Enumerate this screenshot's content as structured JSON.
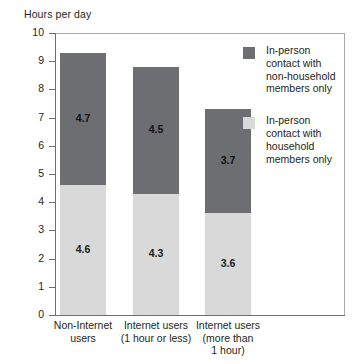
{
  "chart_data": {
    "type": "bar",
    "stacked": true,
    "title": "Hours per day",
    "xlabel": "",
    "ylabel": "Hours per day",
    "ylim": [
      0,
      10
    ],
    "ytick_labels": [
      "10",
      "9",
      "8",
      "7",
      "6",
      "5",
      "4",
      "3",
      "2",
      "1",
      "0"
    ],
    "ytick_values": [
      10,
      9,
      8,
      7,
      6,
      5,
      4,
      3,
      2,
      1,
      0
    ],
    "grid": false,
    "legend_position": "right",
    "categories": [
      "Non-Internet\nusers",
      "Internet users\n(1 hour or less)",
      "Internet users\n(more than\n1 hour)"
    ],
    "series": [
      {
        "name": "In-person\ncontact with\nhousehold\nmembers only",
        "color": "#d9d9d9",
        "values": [
          4.6,
          4.3,
          3.6
        ],
        "labels": [
          "4.6",
          "4.3",
          "3.6"
        ]
      },
      {
        "name": "In-person\ncontact with\nnon-household\nmembers only",
        "color": "#6d6e71",
        "values": [
          4.7,
          4.5,
          3.7
        ],
        "labels": [
          "4.7",
          "4.5",
          "3.7"
        ]
      }
    ],
    "totals": [
      9.3,
      8.8,
      7.3
    ]
  },
  "legend": {
    "items": [
      {
        "label": "In-person\ncontact with\nnon-household\nmembers only",
        "color": "#6d6e71"
      },
      {
        "label": "In-person\ncontact with\nhousehold\nmembers only",
        "color": "#d9d9d9"
      }
    ]
  }
}
